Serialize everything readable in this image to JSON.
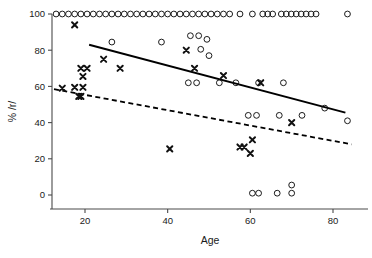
{
  "chart_data": {
    "type": "scatter",
    "title": "",
    "xlabel": "Age",
    "ylabel": "% /r/",
    "xlim": [
      12,
      87
    ],
    "ylim": [
      -6,
      104
    ],
    "xticks": [
      20,
      40,
      60,
      80
    ],
    "yticks": [
      0,
      20,
      40,
      60,
      80,
      100
    ],
    "grid": false,
    "legend": "none",
    "series": [
      {
        "name": "open-circle-group",
        "marker": "open-circle",
        "color": "#111111",
        "points": [
          [
            13.0,
            100
          ],
          [
            14.5,
            100
          ],
          [
            16.0,
            100
          ],
          [
            17.5,
            100
          ],
          [
            19.0,
            100
          ],
          [
            20.5,
            100
          ],
          [
            22.0,
            100
          ],
          [
            23.5,
            100
          ],
          [
            25.0,
            100
          ],
          [
            26.5,
            100
          ],
          [
            28.0,
            100
          ],
          [
            29.5,
            100
          ],
          [
            31.0,
            100
          ],
          [
            32.5,
            100
          ],
          [
            34.0,
            100
          ],
          [
            35.5,
            100
          ],
          [
            37.0,
            100
          ],
          [
            38.5,
            100
          ],
          [
            40.0,
            100
          ],
          [
            41.5,
            100
          ],
          [
            43.0,
            100
          ],
          [
            44.5,
            100
          ],
          [
            46.0,
            100
          ],
          [
            47.5,
            100
          ],
          [
            49.0,
            100
          ],
          [
            50.5,
            100
          ],
          [
            52.0,
            100
          ],
          [
            53.5,
            100
          ],
          [
            55.0,
            100
          ],
          [
            57.5,
            100
          ],
          [
            60.5,
            100
          ],
          [
            63.0,
            100
          ],
          [
            64.2,
            100
          ],
          [
            65.4,
            100
          ],
          [
            67.5,
            100
          ],
          [
            68.7,
            100
          ],
          [
            69.9,
            100
          ],
          [
            71.1,
            100
          ],
          [
            72.3,
            100
          ],
          [
            73.5,
            100
          ],
          [
            74.7,
            100
          ],
          [
            75.9,
            100
          ],
          [
            83.5,
            100
          ],
          [
            26.5,
            84.5
          ],
          [
            38.5,
            84.5
          ],
          [
            45.5,
            88.0
          ],
          [
            47.5,
            88.0
          ],
          [
            49.5,
            86.0
          ],
          [
            48.0,
            80.5
          ],
          [
            50.0,
            77.0
          ],
          [
            45.0,
            62.0
          ],
          [
            47.0,
            62.0
          ],
          [
            52.5,
            62.0
          ],
          [
            56.5,
            62.0
          ],
          [
            62.0,
            62.0
          ],
          [
            68.0,
            62.0
          ],
          [
            59.5,
            44.0
          ],
          [
            61.5,
            44.0
          ],
          [
            67.0,
            44.0
          ],
          [
            72.5,
            44.0
          ],
          [
            78.0,
            48.0
          ],
          [
            83.5,
            41.0
          ],
          [
            60.5,
            1.0
          ],
          [
            62.0,
            1.0
          ],
          [
            66.5,
            1.0
          ],
          [
            70.0,
            1.0
          ],
          [
            70.0,
            5.5
          ]
        ]
      },
      {
        "name": "cross-group",
        "marker": "cross",
        "color": "#111111",
        "points": [
          [
            17.5,
            94.0
          ],
          [
            19.0,
            70.0
          ],
          [
            20.5,
            70.0
          ],
          [
            24.5,
            75.0
          ],
          [
            19.5,
            65.5
          ],
          [
            17.5,
            59.5
          ],
          [
            19.5,
            59.5
          ],
          [
            14.5,
            59.0
          ],
          [
            18.5,
            54.5
          ],
          [
            19.0,
            54.5
          ],
          [
            28.5,
            70.0
          ],
          [
            44.5,
            80.0
          ],
          [
            46.5,
            70.0
          ],
          [
            40.5,
            25.5
          ],
          [
            53.5,
            66.0
          ],
          [
            57.5,
            26.5
          ],
          [
            58.5,
            26.5
          ],
          [
            60.5,
            30.5
          ],
          [
            60.0,
            23.0
          ],
          [
            62.5,
            62.0
          ],
          [
            70.0,
            40.0
          ]
        ]
      }
    ],
    "fit_lines": [
      {
        "name": "solid-regression-line",
        "style": "solid",
        "color": "#000000",
        "x0": 21.0,
        "y0": 83.0,
        "x1": 83.0,
        "y1": 45.5
      },
      {
        "name": "dashed-regression-line",
        "style": "dashed",
        "color": "#000000",
        "x0": 12.5,
        "y0": 58.5,
        "x1": 84.5,
        "y1": 28.0
      }
    ]
  },
  "axes": {
    "x_label": "Age",
    "y_label": "% /r/",
    "x_tick_labels": [
      "20",
      "40",
      "60",
      "80"
    ],
    "y_tick_labels": [
      "0",
      "20",
      "40",
      "60",
      "80",
      "100"
    ]
  }
}
